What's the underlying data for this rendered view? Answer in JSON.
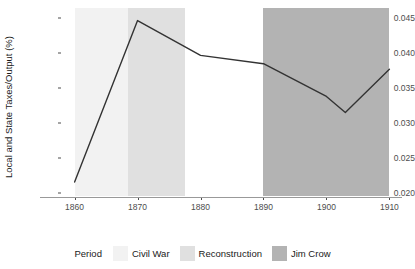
{
  "chart_data": {
    "type": "line",
    "title": "",
    "xlabel": "",
    "ylabel": "Local and State Taxes/Output (%)",
    "xlim": [
      1858,
      1912
    ],
    "ylim": [
      0.0195,
      0.0465
    ],
    "grid": false,
    "x_ticks": [
      1860,
      1870,
      1880,
      1890,
      1900,
      1910
    ],
    "x_tick_labels": [
      "1860",
      "1870",
      "1880",
      "1890",
      "1900",
      "1910"
    ],
    "y_ticks": [
      0.02,
      0.025,
      0.03,
      0.035,
      0.04,
      0.045
    ],
    "y_tick_labels": [
      "0.020",
      "0.025",
      "0.030",
      "0.035",
      "0.040",
      "0.045"
    ],
    "x": [
      1860,
      1870,
      1880,
      1890,
      1900,
      1903,
      1910
    ],
    "values": [
      0.0215,
      0.0447,
      0.0397,
      0.0385,
      0.0338,
      0.0315,
      0.0377
    ],
    "series": [
      {
        "name": "Local and State Taxes/Output",
        "color": "#333333",
        "x": [
          1860,
          1870,
          1880,
          1890,
          1900,
          1903,
          1910
        ],
        "values": [
          0.0215,
          0.0447,
          0.0397,
          0.0385,
          0.0338,
          0.0315,
          0.0377
        ]
      }
    ],
    "bands": [
      {
        "name": "Civil War",
        "start": 1860,
        "end": 1868.5,
        "color": "#f2f2f2"
      },
      {
        "name": "Reconstruction",
        "start": 1868.5,
        "end": 1877.5,
        "color": "#e0e0e0"
      },
      {
        "name": "Jim Crow",
        "start": 1890,
        "end": 1910,
        "color": "#b3b3b3"
      }
    ],
    "legend": {
      "title": "Period",
      "position": "bottom",
      "entries": [
        {
          "label": "Civil War",
          "color": "#f2f2f2"
        },
        {
          "label": "Reconstruction",
          "color": "#e0e0e0"
        },
        {
          "label": "Jim Crow",
          "color": "#b3b3b3"
        }
      ]
    }
  }
}
